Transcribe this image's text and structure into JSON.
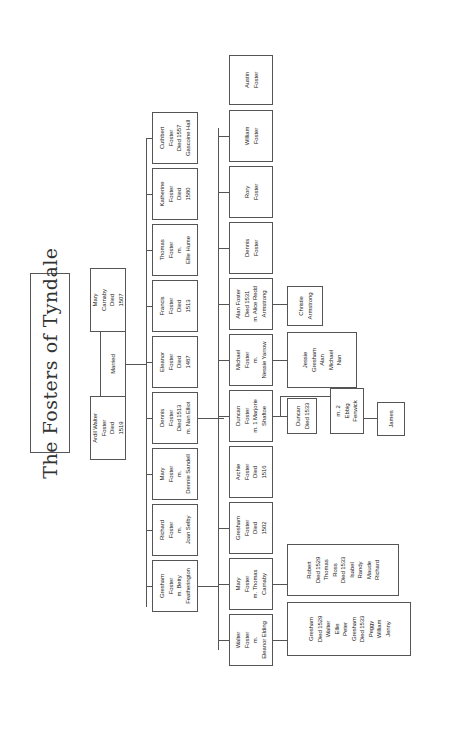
{
  "title": "The Fosters of Tyndale",
  "orientation": "rotated 90deg counter-clockwise",
  "parents": {
    "father": {
      "lines": [
        "Ardil Walter",
        "Foster",
        "Died",
        "1519"
      ]
    },
    "mother": {
      "lines": [
        "Mary",
        "Carnaby",
        "Died",
        "1507"
      ]
    },
    "union_label": "Married"
  },
  "children": [
    {
      "id": "c1",
      "lines": [
        "Cuthbert",
        "Foster",
        "Died 1557",
        "Gascoine Hall"
      ]
    },
    {
      "id": "c2",
      "lines": [
        "Katherine",
        "Foster",
        "Died",
        "1580"
      ]
    },
    {
      "id": "c3",
      "lines": [
        "Thomas",
        "Foster",
        "m.",
        "Ellie Hume"
      ]
    },
    {
      "id": "c4",
      "lines": [
        "Francis",
        "Foster",
        "Died",
        "1513"
      ]
    },
    {
      "id": "c5",
      "lines": [
        "Eleanor",
        "Foster",
        "Died",
        "1487"
      ]
    },
    {
      "id": "c6",
      "lines": [
        "Dennis",
        "Foster",
        "Died 1513",
        "m. Nan Elliot"
      ]
    },
    {
      "id": "c7",
      "lines": [
        "Mary",
        "Foster",
        "m.",
        "Dennie Sandell"
      ]
    },
    {
      "id": "c8",
      "lines": [
        "Richard",
        "Foster",
        "m.",
        "Joan Selby"
      ]
    },
    {
      "id": "c9",
      "lines": [
        "Gresham",
        "Foster",
        "m. Betty",
        "Featherington"
      ]
    }
  ],
  "grandchildren": [
    {
      "id": "g1",
      "lines": [
        "Austin",
        "Foster"
      ]
    },
    {
      "id": "g2",
      "lines": [
        "William",
        "Foster"
      ]
    },
    {
      "id": "g3",
      "lines": [
        "Rory",
        "Foster"
      ]
    },
    {
      "id": "g4",
      "lines": [
        "Dennis",
        "Foster"
      ]
    },
    {
      "id": "g5",
      "lines": [
        "Alan Foster",
        "Died 1531",
        "m. Alice Redd",
        "Armstrong"
      ]
    },
    {
      "id": "g6",
      "lines": [
        "Michael",
        "Foster",
        "m.",
        "Nessie Yarrow"
      ]
    },
    {
      "id": "g7",
      "lines": [
        "Duncan",
        "Foster",
        "m. 1 Marjorie",
        "Shaftoe"
      ]
    },
    {
      "id": "g8",
      "lines": [
        "Archie",
        "Foster",
        "Died",
        "1516"
      ]
    },
    {
      "id": "g9",
      "lines": [
        "Gresham",
        "Foster",
        "Died",
        "1502"
      ]
    },
    {
      "id": "g10",
      "lines": [
        "Mary",
        "Foster",
        "m. Thomas",
        "Carnaby"
      ]
    },
    {
      "id": "g11",
      "lines": [
        "Walter",
        "Foster",
        "m.",
        "Eleanor Elding"
      ]
    }
  ],
  "great_grandchildren": [
    {
      "id": "gg1",
      "lines": [
        "Christie",
        "Armstrong"
      ]
    },
    {
      "id": "gg2",
      "lines": [
        "Jessie",
        "Gresham",
        "Alan",
        "Michael",
        "Nan"
      ]
    },
    {
      "id": "gg3",
      "lines": [
        "Duncan",
        "Died 1533"
      ]
    },
    {
      "id": "gg4",
      "lines": [
        "m. 2",
        "Ebbig",
        "Fenwick"
      ]
    },
    {
      "id": "gg5",
      "lines": [
        "James"
      ]
    },
    {
      "id": "gg6",
      "lines": [
        "Robert",
        "Died 1529",
        "Thomas",
        "Ross",
        "Died 1533",
        "Isabel",
        "Randy",
        "Maude",
        "Richard"
      ]
    },
    {
      "id": "gg7",
      "lines": [
        "Gresham",
        "Died 1529",
        "Walter",
        "Ellie",
        "Peter",
        "Gresham",
        "Died 1533",
        "Peggy",
        "William",
        "Jenny"
      ]
    }
  ]
}
